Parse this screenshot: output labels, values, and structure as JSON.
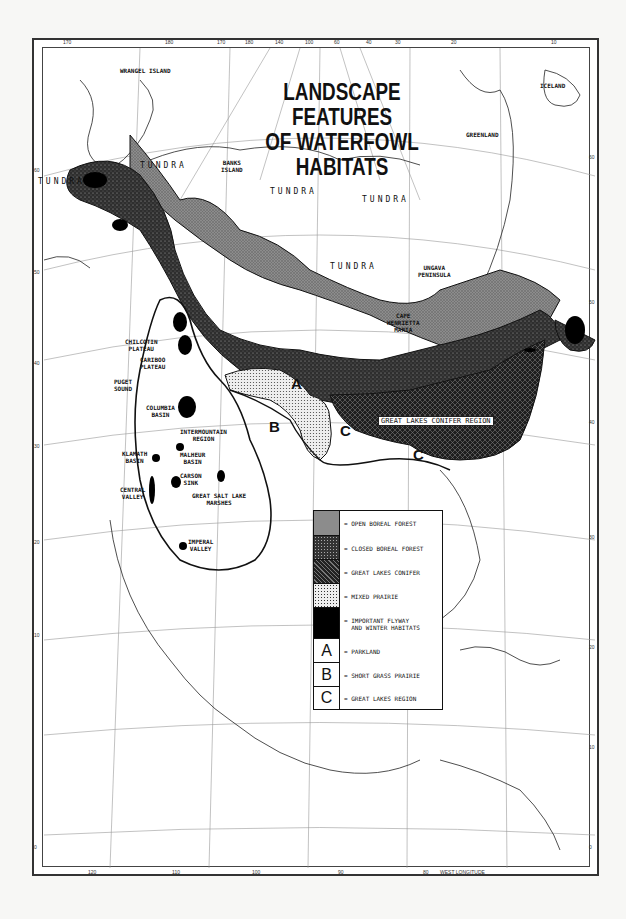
{
  "map": {
    "title_line1": "LANDSCAPE FEATURES",
    "title_line2": "OF WATERFOWL HABITATS",
    "projection_note": "WEST LONGITUDE",
    "top_longitude_ticks": [
      "170",
      "180",
      "170",
      "180",
      "140",
      "100",
      "60",
      "40",
      "30",
      "20",
      "10"
    ],
    "bottom_longitude_ticks": [
      "120",
      "110",
      "100",
      "90",
      "80"
    ],
    "left_latitude_ticks": [
      "60",
      "50",
      "40",
      "30",
      "20",
      "10",
      "0"
    ],
    "right_latitude_ticks": [
      "60",
      "50",
      "40",
      "30",
      "20",
      "10",
      "0"
    ],
    "place_labels": {
      "wrangel_island": "WRANGEL ISLAND",
      "iceland": "ICELAND",
      "greenland": "GREENLAND",
      "banks_island": "BANKS\nISLAND",
      "ungava_peninsula": "UNGAVA\nPENINSULA",
      "cape_henrietta_maria": "CAPE\nHENRIETTA\nMARIA",
      "chilcotin_plateau": "CHILCOTIN\nPLATEAU",
      "cariboo_plateau": "CARIBOO\nPLATEAU",
      "puget_sound": "PUGET\nSOUND",
      "columbia_basin": "COLUMBIA\nBASIN",
      "intermountain_region": "INTERMOUNTAIN\nREGION",
      "klamath_basin": "KLAMATH\nBASIN",
      "malheur_basin": "MALHEUR\nBASIN",
      "carson_sink": "CARSON\nSINK",
      "central_valley": "CENTRAL\nVALLEY",
      "great_salt_lake_marshes": "GREAT SALT LAKE\nMARSHES",
      "imperial_valley": "IMPERAL\nVALLEY",
      "great_lakes_conifer_region": "GREAT LAKES CONIFER REGION"
    },
    "tundra_labels": [
      "TUNDRA",
      "TUNDRA",
      "TUNDRA",
      "TUNDRA",
      "TUNDRA"
    ],
    "region_letters": {
      "a": "A",
      "b": "B",
      "c1": "C",
      "c2": "C"
    }
  },
  "legend": {
    "items": [
      {
        "swatch": "open-boreal-forest",
        "label": "= OPEN BOREAL FOREST",
        "fill": "#8a8a8a"
      },
      {
        "swatch": "closed-boreal-forest",
        "label": "= CLOSED BOREAL FOREST",
        "fill": "#3a3a3a"
      },
      {
        "swatch": "great-lakes-conifer",
        "label": "= GREAT LAKES CONIFER",
        "fill": "#2a2a2a"
      },
      {
        "swatch": "mixed-prairie",
        "label": "= MIXED PRAIRIE",
        "fill": "#d8d8d8"
      },
      {
        "swatch": "important-flyway",
        "label": "= IMPORTANT FLYWAY\n  AND WINTER HABITATS",
        "fill": "#000000"
      },
      {
        "swatch": "A",
        "label": "= PARKLAND",
        "fill": "#ffffff"
      },
      {
        "swatch": "B",
        "label": "= SHORT GRASS PRAIRIE",
        "fill": "#ffffff"
      },
      {
        "swatch": "C",
        "label": "= GREAT LAKES REGION",
        "fill": "#ffffff"
      }
    ]
  }
}
